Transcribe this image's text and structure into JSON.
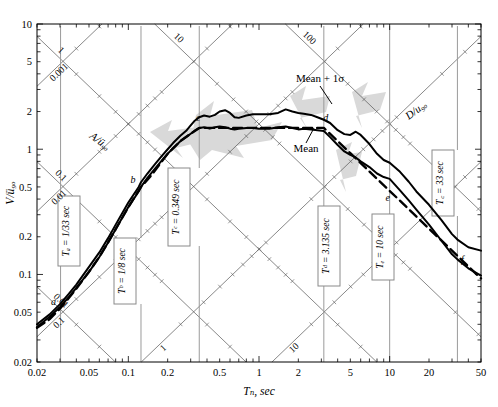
{
  "figure": {
    "axis_labels": {
      "x": "Tₙ, sec",
      "y": "V/ü₉ₒ",
      "diag_left": "A/ü₉ₒ",
      "diag_right": "D/u₉ₒ"
    }
  },
  "chart_data": {
    "type": "line",
    "xlabel": "Tₙ, sec",
    "ylabel": "V/ü₉ₒ",
    "xscale": "log",
    "yscale": "log",
    "xlim": [
      0.02,
      50
    ],
    "ylim": [
      0.02,
      10
    ],
    "grid": false,
    "legend_position": "inline-annotations",
    "x_tick_labels": [
      "0.02",
      "0.05",
      "0.1",
      "0.2",
      "0.5",
      "1",
      "2",
      "5",
      "10",
      "20",
      "50"
    ],
    "y_tick_labels": [
      "0.02",
      "0.05",
      "0.1",
      "0.2",
      "0.5",
      "1",
      "2",
      "5",
      "10"
    ],
    "diagonal_axes": [
      {
        "name": "A/ü₉ₒ",
        "label": "A/ü₉ₒ",
        "direction": "down-right",
        "tick_labels": [
          "100",
          "10",
          "1",
          "0.1",
          "0.01",
          "0.001"
        ]
      },
      {
        "name": "D/u₉ₒ",
        "label": "D/u₉ₒ",
        "direction": "up-right",
        "tick_labels": [
          "0.001",
          "0.01",
          "0.1",
          "1",
          "10"
        ]
      }
    ],
    "series": [
      {
        "name": "Mean + 1σ",
        "style": "solid",
        "annotation": "Mean + 1σ",
        "points": [
          [
            0.02,
            0.04
          ],
          [
            0.025,
            0.048
          ],
          [
            0.03,
            0.058
          ],
          [
            0.035,
            0.07
          ],
          [
            0.04,
            0.083
          ],
          [
            0.05,
            0.115
          ],
          [
            0.06,
            0.15
          ],
          [
            0.07,
            0.195
          ],
          [
            0.08,
            0.25
          ],
          [
            0.09,
            0.31
          ],
          [
            0.1,
            0.375
          ],
          [
            0.12,
            0.5
          ],
          [
            0.125,
            0.545
          ],
          [
            0.14,
            0.64
          ],
          [
            0.16,
            0.76
          ],
          [
            0.18,
            0.88
          ],
          [
            0.2,
            1.0
          ],
          [
            0.22,
            1.12
          ],
          [
            0.25,
            1.28
          ],
          [
            0.28,
            1.42
          ],
          [
            0.3,
            1.55
          ],
          [
            0.32,
            1.68
          ],
          [
            0.349,
            1.8
          ],
          [
            0.38,
            1.86
          ],
          [
            0.42,
            1.82
          ],
          [
            0.46,
            1.88
          ],
          [
            0.5,
            2.0
          ],
          [
            0.55,
            2.05
          ],
          [
            0.6,
            1.95
          ],
          [
            0.65,
            1.8
          ],
          [
            0.7,
            1.78
          ],
          [
            0.8,
            1.86
          ],
          [
            0.9,
            1.9
          ],
          [
            1.0,
            1.9
          ],
          [
            1.2,
            1.9
          ],
          [
            1.4,
            1.95
          ],
          [
            1.6,
            2.08
          ],
          [
            1.8,
            2.0
          ],
          [
            2.0,
            1.95
          ],
          [
            2.2,
            1.92
          ],
          [
            2.5,
            1.88
          ],
          [
            2.8,
            1.8
          ],
          [
            3.135,
            1.72
          ],
          [
            3.5,
            1.62
          ],
          [
            4.0,
            1.42
          ],
          [
            4.5,
            1.32
          ],
          [
            5.0,
            1.3
          ],
          [
            5.5,
            1.38
          ],
          [
            6.0,
            1.3
          ],
          [
            7.0,
            1.1
          ],
          [
            8.0,
            0.92
          ],
          [
            9.0,
            0.82
          ],
          [
            10.0,
            0.78
          ],
          [
            12.0,
            0.66
          ],
          [
            14.0,
            0.55
          ],
          [
            16.0,
            0.46
          ],
          [
            20.0,
            0.36
          ],
          [
            25.0,
            0.27
          ],
          [
            30.0,
            0.21
          ],
          [
            33.0,
            0.19
          ],
          [
            40.0,
            0.165
          ],
          [
            50.0,
            0.155
          ]
        ]
      },
      {
        "name": "Mean",
        "style": "solid",
        "annotation": "Mean",
        "points": [
          [
            0.02,
            0.038
          ],
          [
            0.025,
            0.046
          ],
          [
            0.03,
            0.055
          ],
          [
            0.035,
            0.066
          ],
          [
            0.04,
            0.078
          ],
          [
            0.05,
            0.105
          ],
          [
            0.06,
            0.138
          ],
          [
            0.07,
            0.18
          ],
          [
            0.08,
            0.23
          ],
          [
            0.09,
            0.285
          ],
          [
            0.1,
            0.345
          ],
          [
            0.12,
            0.46
          ],
          [
            0.125,
            0.5
          ],
          [
            0.14,
            0.59
          ],
          [
            0.16,
            0.7
          ],
          [
            0.18,
            0.81
          ],
          [
            0.2,
            0.92
          ],
          [
            0.22,
            1.02
          ],
          [
            0.25,
            1.16
          ],
          [
            0.28,
            1.26
          ],
          [
            0.3,
            1.33
          ],
          [
            0.32,
            1.4
          ],
          [
            0.349,
            1.48
          ],
          [
            0.38,
            1.5
          ],
          [
            0.42,
            1.46
          ],
          [
            0.46,
            1.5
          ],
          [
            0.5,
            1.52
          ],
          [
            0.55,
            1.5
          ],
          [
            0.6,
            1.46
          ],
          [
            0.65,
            1.44
          ],
          [
            0.7,
            1.46
          ],
          [
            0.8,
            1.48
          ],
          [
            0.9,
            1.48
          ],
          [
            1.0,
            1.46
          ],
          [
            1.2,
            1.46
          ],
          [
            1.4,
            1.5
          ],
          [
            1.6,
            1.52
          ],
          [
            1.8,
            1.48
          ],
          [
            2.0,
            1.44
          ],
          [
            2.2,
            1.46
          ],
          [
            2.5,
            1.44
          ],
          [
            2.8,
            1.42
          ],
          [
            3.135,
            1.4
          ],
          [
            3.5,
            1.25
          ],
          [
            4.0,
            1.08
          ],
          [
            4.5,
            0.96
          ],
          [
            5.0,
            0.9
          ],
          [
            5.5,
            0.86
          ],
          [
            6.0,
            0.8
          ],
          [
            7.0,
            0.72
          ],
          [
            8.0,
            0.64
          ],
          [
            9.0,
            0.6
          ],
          [
            10.0,
            0.58
          ],
          [
            12.0,
            0.47
          ],
          [
            14.0,
            0.39
          ],
          [
            16.0,
            0.33
          ],
          [
            20.0,
            0.25
          ],
          [
            25.0,
            0.185
          ],
          [
            30.0,
            0.145
          ],
          [
            33.0,
            0.132
          ],
          [
            40.0,
            0.112
          ],
          [
            50.0,
            0.098
          ]
        ]
      },
      {
        "name": "Design spectrum",
        "style": "dashed",
        "points": [
          [
            0.02,
            0.0375
          ],
          [
            0.025,
            0.044
          ],
          [
            0.0303,
            0.054
          ],
          [
            0.04,
            0.077
          ],
          [
            0.05,
            0.105
          ],
          [
            0.06,
            0.138
          ],
          [
            0.07,
            0.18
          ],
          [
            0.08,
            0.23
          ],
          [
            0.09,
            0.285
          ],
          [
            0.1,
            0.345
          ],
          [
            0.125,
            0.5
          ],
          [
            0.15,
            0.62
          ],
          [
            0.2,
            0.92
          ],
          [
            0.25,
            1.16
          ],
          [
            0.3,
            1.33
          ],
          [
            0.349,
            1.48
          ],
          [
            0.5,
            1.48
          ],
          [
            1.0,
            1.48
          ],
          [
            2.0,
            1.48
          ],
          [
            3.135,
            1.48
          ],
          [
            4.0,
            1.16
          ],
          [
            5.0,
            0.93
          ],
          [
            6.0,
            0.775
          ],
          [
            8.0,
            0.58
          ],
          [
            10.0,
            0.465
          ],
          [
            14.0,
            0.332
          ],
          [
            20.0,
            0.232
          ],
          [
            30.0,
            0.155
          ],
          [
            33.0,
            0.141
          ],
          [
            40.0,
            0.116
          ],
          [
            50.0,
            0.093
          ]
        ]
      }
    ],
    "control_points": [
      {
        "id": "a",
        "label": "a",
        "T": 0.0303,
        "V": 0.054
      },
      {
        "id": "b",
        "label": "b",
        "T": 0.125,
        "V": 0.5
      },
      {
        "id": "c",
        "label": "c",
        "T": 0.349,
        "V": 1.48
      },
      {
        "id": "d",
        "label": "d",
        "T": 3.135,
        "V": 1.48
      },
      {
        "id": "e",
        "label": "e",
        "T": 10.0,
        "V": 0.465
      },
      {
        "id": "f",
        "label": "f",
        "T": 33.0,
        "V": 0.141
      }
    ],
    "annotations": [
      {
        "name": "mean-plus-sigma-label",
        "text": "Mean + 1σ"
      },
      {
        "name": "mean-label",
        "text": "Mean"
      }
    ],
    "callout_boxes": [
      {
        "id": "Ta",
        "text": "Tₐ = 1/33 sec",
        "T": 0.0303
      },
      {
        "id": "Tb",
        "text": "Tᵇ = 1/8 sec",
        "T": 0.125
      },
      {
        "id": "Tc",
        "text": "Tᶜ = 0.349 sec",
        "T": 0.349
      },
      {
        "id": "Td",
        "text": "Tᵈ = 3.135 sec",
        "T": 3.135
      },
      {
        "id": "Te",
        "text": "Tₑ = 10 sec",
        "T": 10.0
      },
      {
        "id": "Tf",
        "text": "T꜀ = 33 sec",
        "T": 33.0
      }
    ],
    "shaded_regions": [
      {
        "name": "amplification-region-1",
        "color": "#d9d9d9"
      },
      {
        "name": "amplification-region-2",
        "color": "#d9d9d9"
      },
      {
        "name": "amplification-region-3",
        "color": "#d9d9d9"
      }
    ]
  },
  "callouts": {
    "Ta": "Tₐ = 1/33 sec",
    "Tb": "Tᵇ = 1/8 sec",
    "Tc": "Tᶜ = 0.349 sec",
    "Td": "Tᵈ = 3.135 sec",
    "Te": "Tₑ = 10 sec",
    "Tf": "T꜀ = 33 sec"
  },
  "curve_labels": {
    "mean_sigma": "Mean + 1σ",
    "mean": "Mean"
  },
  "point_labels": {
    "a": "a",
    "b": "b",
    "c": "c",
    "d": "d",
    "e": "e",
    "f": "f"
  },
  "diag_ticks": {
    "left": [
      "100",
      "10",
      "1",
      "0.1",
      "0.01",
      "0.001"
    ],
    "right": [
      "0.001",
      "0.01",
      "0.1",
      "1",
      "10"
    ]
  },
  "x_ticks": [
    "0.02",
    "0.05",
    "0.1",
    "0.2",
    "0.5",
    "1",
    "2",
    "5",
    "10",
    "20",
    "50"
  ],
  "y_ticks": [
    "0.02",
    "0.05",
    "0.1",
    "0.2",
    "0.5",
    "1",
    "2",
    "5",
    "10"
  ],
  "colors": {
    "curve": "#000000",
    "axis": "#000000",
    "shade": "#d9d9d9",
    "callout_line": "#9a9a9a"
  }
}
